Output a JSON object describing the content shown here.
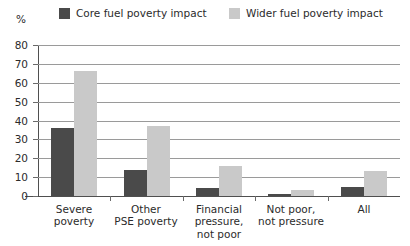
{
  "axis_unit": "%",
  "legend": [
    {
      "label": "Core fuel poverty impact",
      "color": "#4a4a4a",
      "key": "core"
    },
    {
      "label": "Wider fuel poverty impact",
      "color": "#c9c9c9",
      "key": "wider"
    }
  ],
  "y_ticks": [
    "0",
    "10",
    "20",
    "30",
    "40",
    "50",
    "60",
    "70",
    "80"
  ],
  "chart_data": {
    "type": "bar",
    "title": "",
    "xlabel": "",
    "ylabel": "%",
    "ylim": [
      0,
      80
    ],
    "ytick_step": 10,
    "grid": true,
    "legend_position": "top",
    "categories": [
      "Severe\npoverty",
      "Other\nPSE poverty",
      "Financial\npressure,\nnot poor",
      "Not poor,\nnot pressure",
      "All"
    ],
    "series": [
      {
        "name": "Core fuel poverty impact",
        "color": "#4a4a4a",
        "values": [
          36,
          14,
          4,
          1,
          5
        ]
      },
      {
        "name": "Wider fuel poverty impact",
        "color": "#c9c9c9",
        "values": [
          66,
          37,
          16,
          3,
          13
        ]
      }
    ]
  }
}
